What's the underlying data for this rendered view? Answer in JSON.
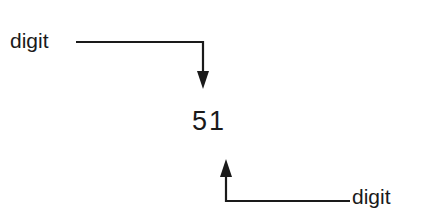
{
  "diagram": {
    "top_label": "digit",
    "number": "51",
    "bottom_label": "digit",
    "stroke_color": "#1a1a1a"
  }
}
